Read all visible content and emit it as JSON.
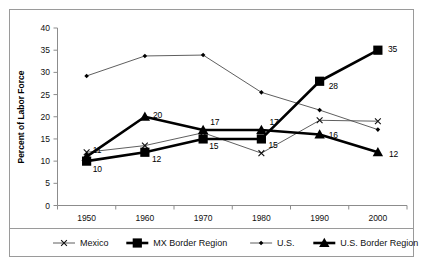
{
  "chart_data": {
    "type": "line",
    "title": "",
    "xlabel": "",
    "ylabel": "Percent of Labor Force",
    "x": [
      1950,
      1960,
      1970,
      1980,
      1990,
      2000
    ],
    "xtick_labels": [
      "1950",
      "1960",
      "1970",
      "1980",
      "1990",
      "2000"
    ],
    "ytick_labels": [
      "0",
      "5",
      "10",
      "15",
      "20",
      "25",
      "30",
      "35",
      "40"
    ],
    "yticks": [
      0,
      5,
      10,
      15,
      20,
      25,
      30,
      35,
      40
    ],
    "ylim": [
      0,
      40
    ],
    "xlim": [
      1945,
      2005
    ],
    "grid": false,
    "legend_position": "bottom",
    "series": [
      {
        "name": "Mexico",
        "marker": "x",
        "line_weight": "thin",
        "values": [
          12.0,
          13.5,
          16.4,
          11.8,
          19.2,
          19.0
        ],
        "labels": [
          "",
          "",
          "",
          "",
          "",
          ""
        ]
      },
      {
        "name": "MX Border Region",
        "marker": "square",
        "line_weight": "thick",
        "values": [
          10.0,
          12.0,
          15.0,
          15.0,
          28.0,
          35.0
        ],
        "labels": [
          "10",
          "12",
          "15",
          "15",
          "28",
          "35"
        ]
      },
      {
        "name": "U.S.",
        "marker": "diamond",
        "line_weight": "thin",
        "values": [
          29.2,
          33.7,
          33.9,
          25.5,
          21.5,
          17.1
        ],
        "labels": [
          "",
          "",
          "",
          "",
          "",
          ""
        ]
      },
      {
        "name": "U.S. Border Region",
        "marker": "triangle",
        "line_weight": "thick",
        "values": [
          11.0,
          20.0,
          17.0,
          17.0,
          16.0,
          12.0
        ],
        "labels": [
          "11",
          "20",
          "17",
          "17",
          "16",
          "12"
        ]
      }
    ]
  },
  "legend": {
    "items": [
      {
        "label": "Mexico"
      },
      {
        "label": "MX Border Region"
      },
      {
        "label": "U.S."
      },
      {
        "label": "U.S. Border Region"
      }
    ]
  }
}
